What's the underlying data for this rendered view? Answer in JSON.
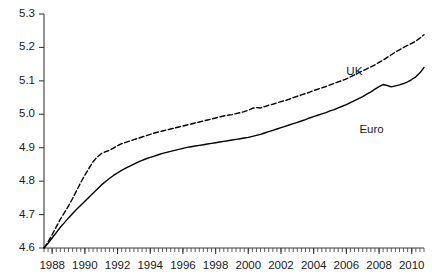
{
  "chart_data": {
    "type": "line",
    "title": "",
    "subtitle": "",
    "xlabel": "",
    "ylabel": "",
    "xlim": [
      1987.5,
      2010.75
    ],
    "ylim": [
      4.6,
      5.3
    ],
    "grid": false,
    "legend_position": "inline-annotation",
    "y_ticks": [
      "4.6",
      "4.7",
      "4.8",
      "4.9",
      "5.0",
      "5.1",
      "5.2",
      "5.3"
    ],
    "y_tick_values": [
      4.6,
      4.7,
      4.8,
      4.9,
      5.0,
      5.1,
      5.2,
      5.3
    ],
    "x_ticks": [
      "1988",
      "1990",
      "1992",
      "1994",
      "1996",
      "1998",
      "2000",
      "2002",
      "2004",
      "2006",
      "2008",
      "2010"
    ],
    "x_tick_values": [
      1988,
      1990,
      1992,
      1994,
      1996,
      1998,
      2000,
      2002,
      2004,
      2006,
      2008,
      2010
    ],
    "x_minor_tick_step": 0.25,
    "annotations": [
      {
        "text": "UK",
        "x": 2006.0,
        "y": 5.145
      },
      {
        "text": "Euro",
        "x": 2006.8,
        "y": 4.972
      }
    ],
    "series": [
      {
        "name": "UK",
        "style": "dashed",
        "color": "#000000",
        "x": [
          1987.5,
          1987.75,
          1988,
          1988.25,
          1988.5,
          1988.75,
          1989,
          1989.25,
          1989.5,
          1989.75,
          1990,
          1990.25,
          1990.5,
          1990.75,
          1991,
          1991.25,
          1991.5,
          1991.75,
          1992,
          1992.25,
          1992.5,
          1992.75,
          1993,
          1993.25,
          1993.5,
          1993.75,
          1994,
          1994.25,
          1994.5,
          1994.75,
          1995,
          1995.25,
          1995.5,
          1995.75,
          1996,
          1996.25,
          1996.5,
          1996.75,
          1997,
          1997.25,
          1997.5,
          1997.75,
          1998,
          1998.25,
          1998.5,
          1998.75,
          1999,
          1999.25,
          1999.5,
          1999.75,
          2000,
          2000.25,
          2000.5,
          2000.75,
          2001,
          2001.25,
          2001.5,
          2001.75,
          2002,
          2002.25,
          2002.5,
          2002.75,
          2003,
          2003.25,
          2003.5,
          2003.75,
          2004,
          2004.25,
          2004.5,
          2004.75,
          2005,
          2005.25,
          2005.5,
          2005.75,
          2006,
          2006.25,
          2006.5,
          2006.75,
          2007,
          2007.25,
          2007.5,
          2007.75,
          2008,
          2008.25,
          2008.5,
          2008.75,
          2009,
          2009.25,
          2009.5,
          2009.75,
          2010,
          2010.25,
          2010.5,
          2010.75
        ],
        "y": [
          4.6,
          4.618,
          4.64,
          4.663,
          4.686,
          4.706,
          4.726,
          4.748,
          4.772,
          4.796,
          4.818,
          4.838,
          4.858,
          4.872,
          4.882,
          4.888,
          4.892,
          4.899,
          4.906,
          4.912,
          4.916,
          4.92,
          4.924,
          4.928,
          4.932,
          4.936,
          4.94,
          4.944,
          4.947,
          4.95,
          4.953,
          4.956,
          4.959,
          4.962,
          4.965,
          4.968,
          4.971,
          4.974,
          4.977,
          4.98,
          4.983,
          4.986,
          4.989,
          4.992,
          4.995,
          4.997,
          4.999,
          5.002,
          5.005,
          5.008,
          5.012,
          5.018,
          5.02,
          5.019,
          5.023,
          5.027,
          5.03,
          5.034,
          5.038,
          5.041,
          5.045,
          5.05,
          5.054,
          5.058,
          5.062,
          5.066,
          5.071,
          5.075,
          5.079,
          5.083,
          5.088,
          5.092,
          5.097,
          5.101,
          5.106,
          5.112,
          5.118,
          5.124,
          5.13,
          5.136,
          5.142,
          5.148,
          5.155,
          5.162,
          5.17,
          5.178,
          5.186,
          5.193,
          5.2,
          5.206,
          5.212,
          5.219,
          5.228,
          5.238
        ]
      },
      {
        "name": "Euro",
        "style": "solid",
        "color": "#000000",
        "x": [
          1987.5,
          1987.75,
          1988,
          1988.25,
          1988.5,
          1988.75,
          1989,
          1989.25,
          1989.5,
          1989.75,
          1990,
          1990.25,
          1990.5,
          1990.75,
          1991,
          1991.25,
          1991.5,
          1991.75,
          1992,
          1992.25,
          1992.5,
          1992.75,
          1993,
          1993.25,
          1993.5,
          1993.75,
          1994,
          1994.25,
          1994.5,
          1994.75,
          1995,
          1995.25,
          1995.5,
          1995.75,
          1996,
          1996.25,
          1996.5,
          1996.75,
          1997,
          1997.25,
          1997.5,
          1997.75,
          1998,
          1998.25,
          1998.5,
          1998.75,
          1999,
          1999.25,
          1999.5,
          1999.75,
          2000,
          2000.25,
          2000.5,
          2000.75,
          2001,
          2001.25,
          2001.5,
          2001.75,
          2002,
          2002.25,
          2002.5,
          2002.75,
          2003,
          2003.25,
          2003.5,
          2003.75,
          2004,
          2004.25,
          2004.5,
          2004.75,
          2005,
          2005.25,
          2005.5,
          2005.75,
          2006,
          2006.25,
          2006.5,
          2006.75,
          2007,
          2007.25,
          2007.5,
          2007.75,
          2008,
          2008.25,
          2008.5,
          2008.75,
          2009,
          2009.25,
          2009.5,
          2009.75,
          2010,
          2010.25,
          2010.5,
          2010.75
        ],
        "y": [
          4.6,
          4.614,
          4.63,
          4.646,
          4.662,
          4.676,
          4.69,
          4.703,
          4.716,
          4.728,
          4.74,
          4.752,
          4.764,
          4.776,
          4.788,
          4.798,
          4.808,
          4.817,
          4.825,
          4.832,
          4.839,
          4.845,
          4.851,
          4.857,
          4.862,
          4.867,
          4.871,
          4.875,
          4.879,
          4.883,
          4.886,
          4.889,
          4.892,
          4.895,
          4.898,
          4.901,
          4.903,
          4.905,
          4.907,
          4.909,
          4.911,
          4.913,
          4.915,
          4.917,
          4.919,
          4.921,
          4.923,
          4.925,
          4.927,
          4.929,
          4.931,
          4.934,
          4.937,
          4.94,
          4.944,
          4.948,
          4.952,
          4.956,
          4.96,
          4.964,
          4.968,
          4.972,
          4.976,
          4.98,
          4.984,
          4.989,
          4.993,
          4.997,
          5.001,
          5.005,
          5.01,
          5.014,
          5.019,
          5.024,
          5.029,
          5.035,
          5.041,
          5.047,
          5.053,
          5.06,
          5.067,
          5.075,
          5.083,
          5.089,
          5.086,
          5.082,
          5.085,
          5.088,
          5.092,
          5.097,
          5.104,
          5.112,
          5.124,
          5.14
        ]
      }
    ]
  }
}
